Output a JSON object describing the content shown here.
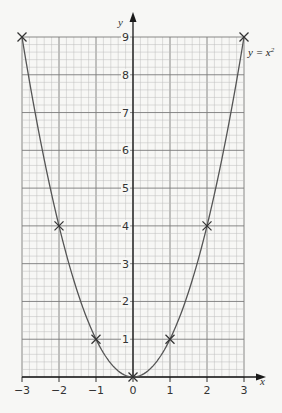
{
  "chart_data": {
    "type": "line",
    "title": "",
    "xlabel": "x",
    "ylabel": "y",
    "xlim": [
      -3,
      3
    ],
    "ylim": [
      0,
      9
    ],
    "x_ticks": [
      -3,
      -2,
      -1,
      0,
      1,
      2,
      3
    ],
    "x_tick_labels": [
      "−3",
      "−2",
      "−1",
      "0",
      "1",
      "2",
      "3"
    ],
    "y_ticks": [
      1,
      2,
      3,
      4,
      5,
      6,
      7,
      8,
      9
    ],
    "y_tick_labels": [
      "1",
      "2",
      "3",
      "4",
      "5",
      "6",
      "7",
      "8",
      "9"
    ],
    "grid": true,
    "minor_divisions_per_unit": 5,
    "series": [
      {
        "name": "y = x²",
        "equation": "y = x^2",
        "x": [
          -3,
          -2,
          -1,
          0,
          1,
          2,
          3
        ],
        "values": [
          9,
          4,
          1,
          0,
          1,
          4,
          9
        ],
        "marker": "cross"
      }
    ],
    "annotations": [
      {
        "text": "y = x",
        "superscript": "2",
        "position": "right of curve at x=3,y≈8.5"
      }
    ]
  },
  "colors": {
    "background": "#f7f7f5",
    "grid_minor": "#bdbdbd",
    "grid_major": "#7a7a7a",
    "axis": "#1a1a1a",
    "curve": "#555555",
    "marker": "#333333"
  }
}
